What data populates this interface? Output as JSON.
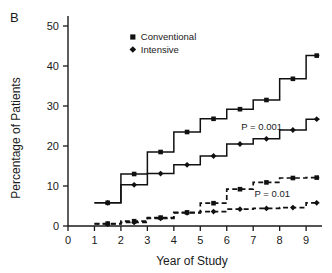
{
  "panel": {
    "label": "B"
  },
  "chart_data": {
    "type": "line",
    "title": "",
    "subtitle": "",
    "xlabel": "Year of Study",
    "ylabel": "Percentage of Patients",
    "xlim": [
      0,
      9.6
    ],
    "ylim": [
      0,
      52
    ],
    "xticks": [
      0,
      1,
      2,
      3,
      4,
      5,
      6,
      7,
      8,
      9
    ],
    "xticklabels": [
      "0",
      "1",
      "2",
      "3",
      "4",
      "5",
      "6",
      "7",
      "8",
      "9"
    ],
    "yticks": [
      0,
      10,
      20,
      30,
      40,
      50
    ],
    "yticklabels": [
      "0",
      "10",
      "20",
      "30",
      "40",
      "50"
    ],
    "grid": false,
    "legend_position": "upper-left-inside",
    "step_style": "post",
    "series": [
      {
        "name": "Conventional",
        "group": "upper",
        "linestyle": "solid",
        "marker": "square",
        "x": [
          1,
          2,
          3,
          4,
          5,
          6,
          7,
          8,
          9,
          9.5
        ],
        "values": [
          5.8,
          13.0,
          18.5,
          23.5,
          26.8,
          29.2,
          31.5,
          36.8,
          42.6,
          42.6
        ],
        "marker_x": [
          1.5,
          2.5,
          3.5,
          4.5,
          5.5,
          6.5,
          7.5,
          8.5,
          9.4
        ],
        "marker_y": [
          5.8,
          13.0,
          18.5,
          23.5,
          26.8,
          29.2,
          31.5,
          36.8,
          42.6
        ]
      },
      {
        "name": "Intensive",
        "group": "upper",
        "linestyle": "solid",
        "marker": "diamond",
        "x": [
          1,
          2,
          3,
          4,
          5,
          6,
          7,
          8,
          9,
          9.5
        ],
        "values": [
          5.8,
          10.3,
          13.1,
          15.3,
          17.5,
          20.5,
          21.8,
          24.0,
          26.7,
          26.7
        ],
        "marker_x": [
          1.5,
          2.5,
          3.5,
          4.5,
          5.5,
          6.5,
          7.5,
          8.5,
          9.4
        ],
        "marker_y": [
          5.8,
          10.3,
          13.1,
          15.3,
          17.5,
          20.5,
          21.8,
          24.0,
          26.7
        ]
      },
      {
        "name": "Conventional",
        "group": "lower",
        "linestyle": "dashed",
        "marker": "square",
        "x": [
          1,
          2,
          3,
          4,
          5,
          6,
          7,
          8,
          9,
          9.5
        ],
        "values": [
          0.6,
          1.2,
          2.1,
          3.4,
          5.7,
          9.2,
          10.9,
          12.0,
          12.1,
          12.1
        ],
        "marker_x": [
          1.5,
          2.5,
          3.5,
          4.5,
          5.5,
          6.5,
          7.5,
          8.5,
          9.4
        ],
        "marker_y": [
          0.6,
          1.2,
          2.1,
          3.4,
          5.7,
          9.2,
          10.9,
          12.0,
          12.1
        ]
      },
      {
        "name": "Intensive",
        "group": "lower",
        "linestyle": "dashed",
        "marker": "diamond",
        "x": [
          1,
          2,
          3,
          4,
          5,
          6,
          7,
          8,
          9,
          9.5
        ],
        "values": [
          0.5,
          0.9,
          1.9,
          3.3,
          3.6,
          4.2,
          4.4,
          4.6,
          5.8,
          5.8
        ],
        "marker_x": [
          1.5,
          2.5,
          3.5,
          4.5,
          5.5,
          6.5,
          7.5,
          8.5,
          9.4
        ],
        "marker_y": [
          0.5,
          0.9,
          1.9,
          3.3,
          3.6,
          4.2,
          4.4,
          4.6,
          5.8
        ]
      }
    ],
    "legend": [
      {
        "label": "Conventional",
        "marker": "square"
      },
      {
        "label": "Intensive",
        "marker": "diamond"
      }
    ],
    "annotations": [
      {
        "text": "P = 0.001",
        "x": 6.55,
        "y": 24.0
      },
      {
        "text": "P = 0.01",
        "x": 7.05,
        "y": 7.3
      }
    ]
  }
}
